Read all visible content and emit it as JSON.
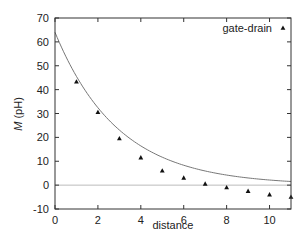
{
  "chart_data": {
    "type": "scatter",
    "title": "",
    "xlabel": "distance",
    "ylabel_italic": "M",
    "ylabel_unit": " (pH)",
    "xlim": [
      0,
      11
    ],
    "ylim": [
      -10,
      70
    ],
    "xticks": [
      0,
      2,
      4,
      6,
      8,
      10
    ],
    "yticks": [
      -10,
      0,
      10,
      20,
      30,
      40,
      50,
      60,
      70
    ],
    "grid": false,
    "legend_position": "top-right",
    "zero_line": true,
    "series": [
      {
        "name": "gate-drain",
        "marker": "triangle",
        "x": [
          1,
          2,
          3,
          4,
          5,
          6,
          7,
          8,
          9,
          10,
          11
        ],
        "y": [
          43.3,
          30.5,
          19.5,
          11.5,
          6,
          3,
          0.5,
          -1,
          -2.5,
          -4,
          -5
        ]
      },
      {
        "name": "fit",
        "style": "line",
        "show_in_legend": false,
        "model": "a*exp(-b*x)",
        "a": 64,
        "b": 0.34
      }
    ]
  },
  "colors": {
    "axis": "#333333",
    "fit_line": "#777777",
    "zero_line": "#bbbbbb",
    "marker": "#111111"
  }
}
